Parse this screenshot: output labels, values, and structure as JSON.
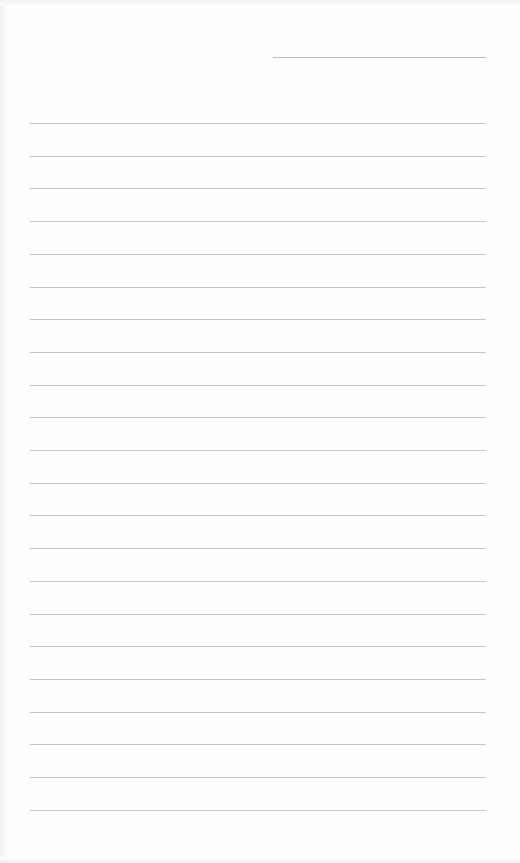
{
  "document": {
    "type": "lined-paper",
    "header_line": {
      "x": 273,
      "y": 57,
      "width": 213
    },
    "lines": {
      "count": 22,
      "first_y": 123,
      "spacing": 32.7,
      "x": 30,
      "width": 456
    },
    "colors": {
      "paper": "#fefefe",
      "rule": "#c4c4c4"
    }
  }
}
